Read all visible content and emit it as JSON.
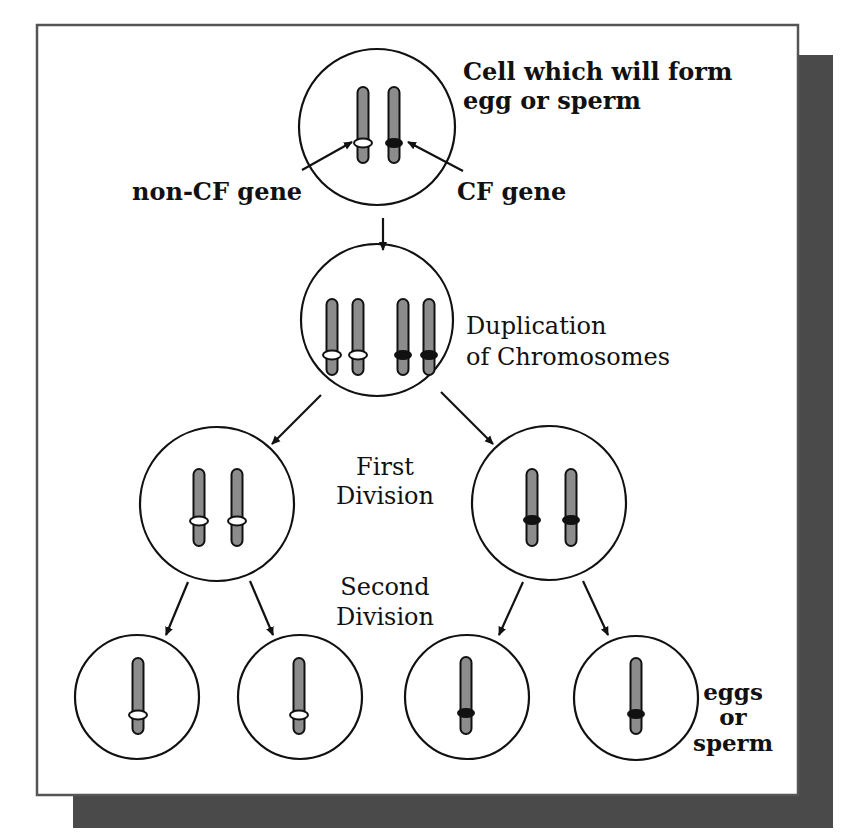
{
  "figure": {
    "colors": {
      "background": "#ffffff",
      "frame_stroke": "#555555",
      "shadow": "#4a4a4a",
      "line": "#111111",
      "chromosome_fill": "#8c8c8c",
      "chromosome_stroke": "#111111",
      "non_cf_band": "#ffffff",
      "cf_band": "#111111"
    },
    "frame": {
      "x": 37,
      "y": 25,
      "w": 761,
      "h": 770
    },
    "shadow": {
      "x": 73,
      "y": 55,
      "w": 760,
      "h": 773
    }
  },
  "labels": {
    "top_cell": {
      "line1": "Cell which will form",
      "line2": "egg or sperm",
      "x": 463,
      "y1": 80,
      "y2": 109,
      "bold": true,
      "anchor": "start",
      "size": 24
    },
    "non_cf_gene": {
      "text": "non-CF gene",
      "x": 132,
      "y": 200,
      "bold": true,
      "anchor": "start",
      "size": 24
    },
    "cf_gene": {
      "text": "CF gene",
      "x": 457,
      "y": 200,
      "bold": true,
      "anchor": "start",
      "size": 24
    },
    "duplication": {
      "line1": "Duplication",
      "line2": "of Chromosomes",
      "x": 466,
      "y1": 334,
      "y2": 365,
      "bold": false,
      "anchor": "start",
      "size": 24
    },
    "first_division": {
      "line1": "First",
      "line2": "Division",
      "x": 385,
      "y1": 475,
      "y2": 504,
      "bold": false,
      "anchor": "middle",
      "size": 24
    },
    "second_division": {
      "line1": "Second",
      "line2": "Division",
      "x": 385,
      "y1": 595,
      "y2": 625,
      "bold": false,
      "anchor": "middle",
      "size": 24
    },
    "gametes": {
      "line1": "eggs",
      "line2": "or",
      "line3": "sperm",
      "x": 733,
      "y1": 700,
      "y2": 725,
      "y3": 751,
      "bold": true,
      "anchor": "middle",
      "size": 23
    }
  },
  "cells": [
    {
      "id": "parent-cell",
      "name": "Cell which will form egg or sperm",
      "cx": 377,
      "cy": 127,
      "r": 78,
      "chromosomes": [
        {
          "x": 363,
          "top": 87,
          "bottom": 163,
          "band_y": 143,
          "gene": "non-CF"
        },
        {
          "x": 394,
          "top": 87,
          "bottom": 163,
          "band_y": 143,
          "gene": "CF"
        }
      ]
    },
    {
      "id": "duplicated-cell",
      "name": "Duplication of Chromosomes",
      "cx": 377,
      "cy": 320,
      "r": 76,
      "chromosomes": [
        {
          "x": 332,
          "top": 299,
          "bottom": 375,
          "band_y": 355,
          "gene": "non-CF"
        },
        {
          "x": 358,
          "top": 299,
          "bottom": 375,
          "band_y": 355,
          "gene": "non-CF"
        },
        {
          "x": 403,
          "top": 299,
          "bottom": 375,
          "band_y": 355,
          "gene": "CF"
        },
        {
          "x": 429,
          "top": 299,
          "bottom": 375,
          "band_y": 355,
          "gene": "CF"
        }
      ]
    },
    {
      "id": "first-division-left",
      "name": "First division daughter cell (non-CF)",
      "cx": 217,
      "cy": 504,
      "r": 77,
      "chromosomes": [
        {
          "x": 199,
          "top": 469,
          "bottom": 546,
          "band_y": 521,
          "gene": "non-CF"
        },
        {
          "x": 237,
          "top": 469,
          "bottom": 546,
          "band_y": 521,
          "gene": "non-CF"
        }
      ]
    },
    {
      "id": "first-division-right",
      "name": "First division daughter cell (CF)",
      "cx": 549,
      "cy": 503,
      "r": 77,
      "chromosomes": [
        {
          "x": 532,
          "top": 469,
          "bottom": 546,
          "band_y": 520,
          "gene": "CF"
        },
        {
          "x": 571,
          "top": 469,
          "bottom": 546,
          "band_y": 520,
          "gene": "CF"
        }
      ]
    },
    {
      "id": "gamete-1",
      "name": "Gamete with non-CF gene",
      "cx": 137,
      "cy": 697,
      "r": 62,
      "chromosomes": [
        {
          "x": 138,
          "top": 658,
          "bottom": 734,
          "band_y": 715,
          "gene": "non-CF"
        }
      ]
    },
    {
      "id": "gamete-2",
      "name": "Gamete with non-CF gene",
      "cx": 300,
      "cy": 697,
      "r": 62,
      "chromosomes": [
        {
          "x": 299,
          "top": 658,
          "bottom": 734,
          "band_y": 715,
          "gene": "non-CF"
        }
      ]
    },
    {
      "id": "gamete-3",
      "name": "Gamete with CF gene",
      "cx": 467,
      "cy": 697,
      "r": 62,
      "chromosomes": [
        {
          "x": 466,
          "top": 657,
          "bottom": 734,
          "band_y": 713,
          "gene": "CF"
        }
      ]
    },
    {
      "id": "gamete-4",
      "name": "Gamete with CF gene",
      "cx": 636,
      "cy": 698,
      "r": 62,
      "chromosomes": [
        {
          "x": 636,
          "top": 658,
          "bottom": 734,
          "band_y": 714,
          "gene": "CF"
        }
      ]
    }
  ],
  "arrows": [
    {
      "id": "arrow-duplication",
      "x1": 383,
      "y1": 218,
      "x2": 383,
      "y2": 250
    },
    {
      "id": "arrow-pointer-non-cf",
      "x1": 302,
      "y1": 170,
      "x2": 352,
      "y2": 142
    },
    {
      "id": "arrow-pointer-cf",
      "x1": 463,
      "y1": 171,
      "x2": 408,
      "y2": 142
    },
    {
      "id": "arrow-first-division-left",
      "x1": 321,
      "y1": 395,
      "x2": 272,
      "y2": 444
    },
    {
      "id": "arrow-first-division-right",
      "x1": 441,
      "y1": 392,
      "x2": 493,
      "y2": 444
    },
    {
      "id": "arrow-second-division-1",
      "x1": 188,
      "y1": 582,
      "x2": 166,
      "y2": 635
    },
    {
      "id": "arrow-second-division-2",
      "x1": 250,
      "y1": 581,
      "x2": 273,
      "y2": 635
    },
    {
      "id": "arrow-second-division-3",
      "x1": 523,
      "y1": 582,
      "x2": 499,
      "y2": 635
    },
    {
      "id": "arrow-second-division-4",
      "x1": 583,
      "y1": 581,
      "x2": 608,
      "y2": 635
    }
  ]
}
